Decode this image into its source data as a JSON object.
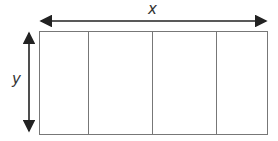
{
  "diagram": {
    "type": "rectangle-divided-into-sections",
    "labels": {
      "width": "x",
      "height": "y"
    },
    "sections": 4,
    "colors": {
      "stroke": "#777777",
      "arrow": "#222222",
      "background": "#ffffff"
    }
  }
}
